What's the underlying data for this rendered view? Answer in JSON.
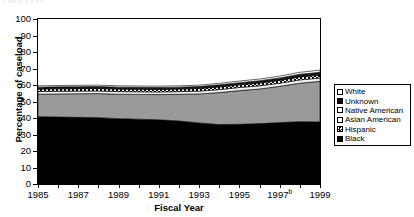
{
  "top_fragment": "1985-1999",
  "chart_data": {
    "type": "area",
    "stacked": true,
    "title": "",
    "xlabel": "Fiscal Year",
    "ylabel": "Percentage of caseload",
    "ylim": [
      0,
      100
    ],
    "xlim": [
      1985,
      1999
    ],
    "grid": false,
    "legend_position": "right",
    "x": [
      1985,
      1986,
      1987,
      1988,
      1989,
      1990,
      1991,
      1992,
      1993,
      1994,
      1995,
      1996,
      1997,
      1998,
      1999
    ],
    "x_tick_labels": [
      "1985",
      "1987",
      "1989",
      "1991",
      "1993",
      "1995",
      "1997ᵇ",
      "1999"
    ],
    "x_tick_values": [
      1985,
      1987,
      1989,
      1991,
      1993,
      1995,
      1997,
      1999
    ],
    "y_tick_labels": [
      "0",
      "10",
      "20",
      "30",
      "40",
      "50",
      "60",
      "70",
      "80",
      "90",
      "100"
    ],
    "y_tick_values": [
      0,
      10,
      20,
      30,
      40,
      50,
      60,
      70,
      80,
      90,
      100
    ],
    "series": [
      {
        "name": "Black",
        "color": "#000000",
        "pattern": "solid",
        "values": [
          40.8,
          40.6,
          40.4,
          40.2,
          39.6,
          39.3,
          38.9,
          38.2,
          37.0,
          36.0,
          36.2,
          36.6,
          37.2,
          37.8,
          37.6
        ]
      },
      {
        "name": "Hispanic",
        "color": "#9a9a9a",
        "pattern": "solid",
        "values": [
          13.6,
          14.0,
          14.3,
          14.6,
          14.8,
          15.0,
          15.3,
          16.2,
          17.6,
          19.4,
          20.4,
          21.0,
          22.0,
          23.3,
          24.6
        ]
      },
      {
        "name": "Asian American",
        "color": "#f2f2f2",
        "pattern": "solid",
        "values": [
          1.6,
          1.6,
          1.6,
          1.6,
          1.6,
          1.6,
          1.6,
          1.6,
          1.7,
          1.8,
          1.9,
          1.9,
          1.9,
          2.0,
          2.0
        ]
      },
      {
        "name": "Native American",
        "color": "#cccccc",
        "pattern": "checker",
        "values": [
          1.5,
          1.5,
          1.5,
          1.5,
          1.5,
          1.5,
          1.5,
          1.5,
          1.6,
          1.6,
          1.6,
          1.7,
          1.7,
          1.8,
          1.8
        ]
      },
      {
        "name": "Unknown",
        "color": "#1a1a1a",
        "pattern": "solid",
        "values": [
          1.2,
          1.2,
          1.2,
          1.2,
          1.2,
          1.2,
          1.2,
          1.2,
          1.2,
          1.3,
          1.3,
          1.4,
          1.5,
          1.6,
          1.7
        ]
      },
      {
        "name": "White",
        "color": "#ffffff",
        "pattern": "solid",
        "values": [
          0.8,
          0.8,
          0.8,
          0.8,
          0.8,
          0.8,
          0.8,
          0.8,
          0.8,
          0.9,
          1.0,
          1.0,
          1.1,
          1.2,
          1.3
        ]
      }
    ],
    "cumulative_top": [
      59.5,
      59.7,
      59.8,
      59.9,
      59.5,
      59.4,
      59.3,
      59.5,
      59.9,
      61.0,
      62.4,
      63.6,
      65.4,
      67.7,
      69.0
    ]
  },
  "legend": {
    "items": [
      {
        "label": "White",
        "swatch": "white"
      },
      {
        "label": "Unknown",
        "swatch": "black"
      },
      {
        "label": "Native American",
        "swatch": "white"
      },
      {
        "label": "Asian American",
        "swatch": "white"
      },
      {
        "label": "Hispanic",
        "swatch": "checker"
      },
      {
        "label": "Black",
        "swatch": "black"
      }
    ]
  }
}
